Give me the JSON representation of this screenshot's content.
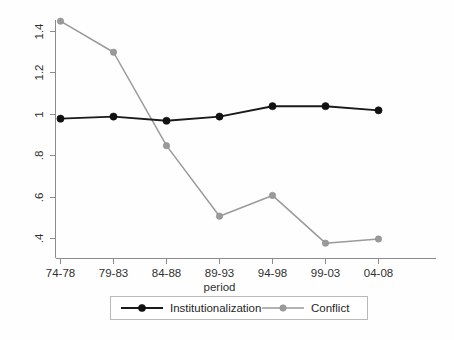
{
  "chart_data": {
    "type": "line",
    "title": "",
    "xlabel": "period",
    "ylabel": "",
    "categories": [
      "74-78",
      "79-83",
      "84-88",
      "89-93",
      "94-98",
      "99-03",
      "04-08"
    ],
    "series": [
      {
        "name": "Institutionalization",
        "color": "#1a1a1a",
        "marker": "filled-circle",
        "values": [
          0.98,
          0.99,
          0.97,
          0.99,
          1.04,
          1.04,
          1.02
        ]
      },
      {
        "name": "Conflict",
        "color": "#9a9a9a",
        "marker": "filled-circle",
        "values": [
          1.45,
          1.3,
          0.85,
          0.51,
          0.61,
          0.38,
          0.4
        ]
      }
    ],
    "ylim": [
      0.33,
      1.5
    ],
    "yticks": [
      0.4,
      0.6,
      0.8,
      1.0,
      1.2,
      1.4
    ],
    "ytick_labels": [
      ".4",
      ".6",
      ".8",
      "1",
      "1.2",
      "1.4"
    ],
    "xtick_labels": [
      "74-78",
      "79-83",
      "84-88",
      "89-93",
      "94-98",
      "99-03",
      "04-08"
    ],
    "grid": false,
    "legend_position": "bottom",
    "legend_entries": [
      "Institutionalization",
      "Conflict"
    ]
  },
  "axes": {
    "x_title": "period",
    "y_tick_0": ".4",
    "y_tick_1": ".6",
    "y_tick_2": ".8",
    "y_tick_3": "1",
    "y_tick_4": "1.2",
    "y_tick_5": "1.4",
    "x_tick_0": "74-78",
    "x_tick_1": "79-83",
    "x_tick_2": "84-88",
    "x_tick_3": "89-93",
    "x_tick_4": "94-98",
    "x_tick_5": "99-03",
    "x_tick_6": "04-08"
  },
  "legend": {
    "entry_0": "Institutionalization",
    "entry_1": "Conflict"
  }
}
